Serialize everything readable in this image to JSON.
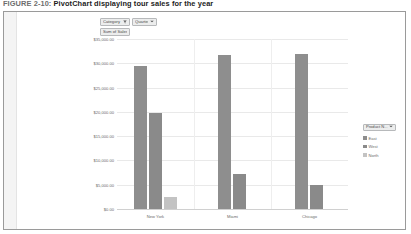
{
  "caption": {
    "figure_number": "FIGURE 2-10:",
    "title": "PivotChart displaying tour sales for the year"
  },
  "pivot_buttons": {
    "category": {
      "label": "Category",
      "icon": "filter-icon"
    },
    "quarter": {
      "label": "Quarter",
      "icon": "chevron-down-icon"
    },
    "value": {
      "label": "Sum of Sales"
    }
  },
  "legend": {
    "title": "Product N...",
    "items": [
      {
        "label": "East",
        "color": "#8e8e8e"
      },
      {
        "label": "West",
        "color": "#8a8a8a"
      },
      {
        "label": "North",
        "color": "#c3c3c3"
      }
    ]
  },
  "colors": {
    "series1": "#8e8e8e",
    "series2": "#8a8a8a",
    "series3": "#c3c3c3",
    "gridline": "#e9e9e9",
    "frame": "#9a9a9a"
  },
  "chart_data": {
    "type": "bar",
    "title": "",
    "xlabel": "",
    "ylabel": "",
    "grid": true,
    "legend_position": "right",
    "ylim": [
      0,
      35000
    ],
    "ytick_labels": [
      "$35,000.00",
      "$30,000.00",
      "$25,000.00",
      "$20,000.00",
      "$15,000.00",
      "$10,000.00",
      "$5,000.00",
      "$0.00"
    ],
    "ytick_values": [
      35000,
      30000,
      25000,
      20000,
      15000,
      10000,
      5000,
      0
    ],
    "categories": [
      "New York",
      "Miami",
      "Chicago"
    ],
    "series": [
      {
        "name": "East",
        "values": [
          29500,
          31800,
          32000
        ]
      },
      {
        "name": "West",
        "values": [
          19800,
          7300,
          5000
        ]
      },
      {
        "name": "North",
        "values": [
          2400,
          null,
          null
        ]
      }
    ]
  }
}
